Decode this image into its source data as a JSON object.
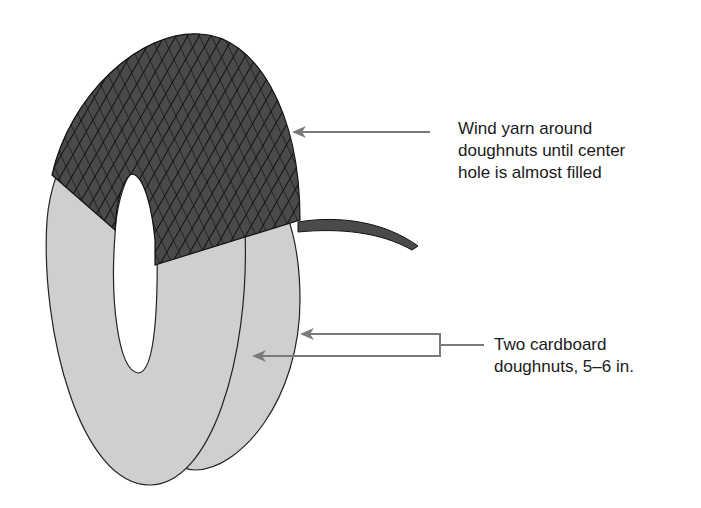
{
  "diagram": {
    "labels": [
      {
        "id": "wind-yarn",
        "lines": [
          "Wind yarn around",
          "doughnuts until center",
          "hole is almost filled"
        ]
      },
      {
        "id": "cardboard-doughnuts",
        "lines": [
          "Two cardboard",
          "doughnuts, 5–6 in."
        ]
      }
    ],
    "colors": {
      "yarn": "#4a4a4a",
      "yarn_lines": "#111111",
      "cardboard": "#cfcfcf",
      "outline": "#222222",
      "arrow": "#7a7a7a",
      "text": "#1a1a1a"
    }
  }
}
